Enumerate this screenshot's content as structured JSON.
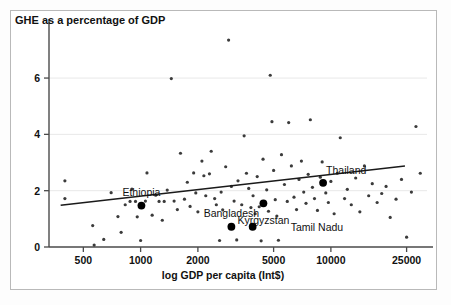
{
  "figure": {
    "background_color": "#ffffff",
    "frame_color": "#b9b9b9"
  },
  "chart_data": {
    "type": "scatter",
    "title": "",
    "ylabel": "GHE as a percentage of GDP",
    "xlabel": "log GDP per capita (Int$)",
    "x_scale": "log",
    "y_scale": "linear",
    "xlim": [
      330,
      32000
    ],
    "ylim": [
      0,
      7.6
    ],
    "grid": true,
    "grid_axis": "y",
    "grid_color": "#e8e8e8",
    "legend": "none",
    "xticks": [
      500,
      1000,
      2000,
      5000,
      10000,
      25000
    ],
    "xticklabels": [
      "500",
      "1000",
      "2000",
      "5000",
      "10000",
      "25000"
    ],
    "yticks": [
      0,
      2,
      4,
      6
    ],
    "yticklabels": [
      "0",
      "2",
      "4",
      "6"
    ],
    "marker_color": "#3b3b3b",
    "marker_size": 2.6,
    "highlight_color": "#000000",
    "highlight_size": 5.0,
    "trendline": {
      "color": "#1a1a1a",
      "width": 1.5,
      "x_start": 380,
      "y_start": 1.48,
      "x_end": 24500,
      "y_end": 2.88
    },
    "highlighted_points": [
      {
        "name": "Ethiopia",
        "x": 1010,
        "y": 1.47,
        "label_dx": 0,
        "label_dy": -14
      },
      {
        "name": "Bangladesh",
        "x": 3000,
        "y": 0.72,
        "label_dx": 0,
        "label_dy": -14
      },
      {
        "name": "Kyrgyzstan",
        "x": 4420,
        "y": 1.55,
        "label_dx": 0,
        "label_dy": 17
      },
      {
        "name": "Tamil Nadu",
        "x": 3880,
        "y": 0.72,
        "label_dx": 38,
        "label_dy": 0
      },
      {
        "name": "Thailand",
        "x": 9100,
        "y": 2.28,
        "label_dx": 3,
        "label_dy": -13
      }
    ],
    "points": [
      {
        "x": 400,
        "y": 2.35
      },
      {
        "x": 400,
        "y": 1.72
      },
      {
        "x": 560,
        "y": 0.76
      },
      {
        "x": 570,
        "y": 0.07
      },
      {
        "x": 640,
        "y": 0.27
      },
      {
        "x": 700,
        "y": 1.93
      },
      {
        "x": 760,
        "y": 1.08
      },
      {
        "x": 790,
        "y": 0.52
      },
      {
        "x": 830,
        "y": 1.5
      },
      {
        "x": 880,
        "y": 1.62
      },
      {
        "x": 900,
        "y": 2.06
      },
      {
        "x": 940,
        "y": 1.62
      },
      {
        "x": 960,
        "y": 1.07
      },
      {
        "x": 1000,
        "y": 0.23
      },
      {
        "x": 1060,
        "y": 1.63
      },
      {
        "x": 1080,
        "y": 2.63
      },
      {
        "x": 1150,
        "y": 1.13
      },
      {
        "x": 1200,
        "y": 1.84
      },
      {
        "x": 1250,
        "y": 1.62
      },
      {
        "x": 1300,
        "y": 0.95
      },
      {
        "x": 1330,
        "y": 1.62
      },
      {
        "x": 1380,
        "y": 2.02
      },
      {
        "x": 1450,
        "y": 5.98
      },
      {
        "x": 1500,
        "y": 1.63
      },
      {
        "x": 1560,
        "y": 1.33
      },
      {
        "x": 1620,
        "y": 3.33
      },
      {
        "x": 1700,
        "y": 1.7
      },
      {
        "x": 1760,
        "y": 2.3
      },
      {
        "x": 1820,
        "y": 1.44
      },
      {
        "x": 1900,
        "y": 2.63
      },
      {
        "x": 1950,
        "y": 1.92
      },
      {
        "x": 2000,
        "y": 1.25
      },
      {
        "x": 2100,
        "y": 3.05
      },
      {
        "x": 2150,
        "y": 2.53
      },
      {
        "x": 2200,
        "y": 1.82
      },
      {
        "x": 2300,
        "y": 2.6
      },
      {
        "x": 2350,
        "y": 3.4
      },
      {
        "x": 2450,
        "y": 1.72
      },
      {
        "x": 2500,
        "y": 1.5
      },
      {
        "x": 2600,
        "y": 0.23
      },
      {
        "x": 2650,
        "y": 1.95
      },
      {
        "x": 2700,
        "y": 1.32
      },
      {
        "x": 2800,
        "y": 2.85
      },
      {
        "x": 2900,
        "y": 7.35
      },
      {
        "x": 3000,
        "y": 2.15
      },
      {
        "x": 3100,
        "y": 1.63
      },
      {
        "x": 3200,
        "y": 0.25
      },
      {
        "x": 3250,
        "y": 2.35
      },
      {
        "x": 3400,
        "y": 1.5
      },
      {
        "x": 3500,
        "y": 3.95
      },
      {
        "x": 3600,
        "y": 2.62
      },
      {
        "x": 3700,
        "y": 2.08
      },
      {
        "x": 3800,
        "y": 1.4
      },
      {
        "x": 3900,
        "y": 1.82
      },
      {
        "x": 4000,
        "y": 1.18
      },
      {
        "x": 4100,
        "y": 2.5
      },
      {
        "x": 4200,
        "y": 1.43
      },
      {
        "x": 4300,
        "y": 0.22
      },
      {
        "x": 4400,
        "y": 3.12
      },
      {
        "x": 4600,
        "y": 2.03
      },
      {
        "x": 4700,
        "y": 1.27
      },
      {
        "x": 4800,
        "y": 6.1
      },
      {
        "x": 4900,
        "y": 4.45
      },
      {
        "x": 5000,
        "y": 2.72
      },
      {
        "x": 5100,
        "y": 1.68
      },
      {
        "x": 5200,
        "y": 1.1
      },
      {
        "x": 5300,
        "y": 0.24
      },
      {
        "x": 5500,
        "y": 3.28
      },
      {
        "x": 5700,
        "y": 2.22
      },
      {
        "x": 5900,
        "y": 1.62
      },
      {
        "x": 6000,
        "y": 4.42
      },
      {
        "x": 6200,
        "y": 2.88
      },
      {
        "x": 6400,
        "y": 1.77
      },
      {
        "x": 6600,
        "y": 1.33
      },
      {
        "x": 6800,
        "y": 2.4
      },
      {
        "x": 7000,
        "y": 3.05
      },
      {
        "x": 7200,
        "y": 1.95
      },
      {
        "x": 7400,
        "y": 1.55
      },
      {
        "x": 7600,
        "y": 2.58
      },
      {
        "x": 7800,
        "y": 4.52
      },
      {
        "x": 8000,
        "y": 2.12
      },
      {
        "x": 8200,
        "y": 1.72
      },
      {
        "x": 8500,
        "y": 1.3
      },
      {
        "x": 8800,
        "y": 2.48
      },
      {
        "x": 9000,
        "y": 3.02
      },
      {
        "x": 9400,
        "y": 1.92
      },
      {
        "x": 9700,
        "y": 1.58
      },
      {
        "x": 10000,
        "y": 2.33
      },
      {
        "x": 10400,
        "y": 1.18
      },
      {
        "x": 10800,
        "y": 2.62
      },
      {
        "x": 11200,
        "y": 3.88
      },
      {
        "x": 11800,
        "y": 1.72
      },
      {
        "x": 12200,
        "y": 2.05
      },
      {
        "x": 12800,
        "y": 1.5
      },
      {
        "x": 13500,
        "y": 2.45
      },
      {
        "x": 14200,
        "y": 1.25
      },
      {
        "x": 15000,
        "y": 2.88
      },
      {
        "x": 15800,
        "y": 1.82
      },
      {
        "x": 16500,
        "y": 2.25
      },
      {
        "x": 17500,
        "y": 1.58
      },
      {
        "x": 18500,
        "y": 1.9
      },
      {
        "x": 19500,
        "y": 2.15
      },
      {
        "x": 20500,
        "y": 1.05
      },
      {
        "x": 22000,
        "y": 1.7
      },
      {
        "x": 23500,
        "y": 2.4
      },
      {
        "x": 25000,
        "y": 0.35
      },
      {
        "x": 26500,
        "y": 1.95
      },
      {
        "x": 28000,
        "y": 4.28
      },
      {
        "x": 29500,
        "y": 2.62
      }
    ]
  }
}
